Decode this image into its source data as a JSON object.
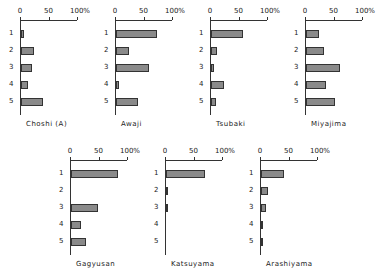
{
  "chart_data": [
    {
      "type": "bar",
      "orientation": "horizontal",
      "title": "Choshi (A)",
      "categories": [
        "1",
        "2",
        "3",
        "4",
        "5"
      ],
      "values": [
        5,
        23,
        20,
        12,
        38
      ],
      "xlim": [
        0,
        100
      ],
      "xticks": [
        "0",
        "50",
        "100%"
      ]
    },
    {
      "type": "bar",
      "orientation": "horizontal",
      "title": "Awaji",
      "categories": [
        "1",
        "2",
        "3",
        "4",
        "5"
      ],
      "values": [
        72,
        22,
        58,
        5,
        38
      ],
      "xlim": [
        0,
        100
      ],
      "xticks": [
        "0",
        "50",
        "100%"
      ]
    },
    {
      "type": "bar",
      "orientation": "horizontal",
      "title": "Tsubaki",
      "categories": [
        "1",
        "2",
        "3",
        "4",
        "5"
      ],
      "values": [
        57,
        10,
        5,
        22,
        8
      ],
      "xlim": [
        0,
        100
      ],
      "xticks": [
        "0",
        "50",
        "100%"
      ]
    },
    {
      "type": "bar",
      "orientation": "horizontal",
      "title": "Miyajima",
      "categories": [
        "1",
        "2",
        "3",
        "4",
        "5"
      ],
      "values": [
        22,
        32,
        60,
        35,
        50
      ],
      "xlim": [
        0,
        100
      ],
      "xticks": [
        "0",
        "50",
        "100%"
      ]
    },
    {
      "type": "bar",
      "orientation": "horizontal",
      "title": "Gagyusan",
      "categories": [
        "1",
        "2",
        "3",
        "4",
        "5"
      ],
      "values": [
        82,
        0,
        48,
        18,
        27
      ],
      "xlim": [
        0,
        100
      ],
      "xticks": [
        "0",
        "50",
        "100%"
      ]
    },
    {
      "type": "bar",
      "orientation": "horizontal",
      "title": "Katsuyama",
      "categories": [
        "1",
        "2",
        "3",
        "4",
        "5"
      ],
      "values": [
        68,
        4,
        2,
        0,
        0
      ],
      "xlim": [
        0,
        100
      ],
      "xticks": [
        "0",
        "50",
        "100%"
      ]
    },
    {
      "type": "bar",
      "orientation": "horizontal",
      "title": "Arashiyama",
      "categories": [
        "1",
        "2",
        "3",
        "4",
        "5"
      ],
      "values": [
        40,
        13,
        8,
        3,
        1
      ],
      "xlim": [
        0,
        100
      ],
      "xticks": [
        "0",
        "50",
        "100%"
      ]
    }
  ],
  "layout": {
    "panel_positions": [
      [
        0,
        0
      ],
      [
        95,
        0
      ],
      [
        190,
        0
      ],
      [
        285,
        0
      ],
      [
        50,
        140
      ],
      [
        145,
        140
      ],
      [
        240,
        140
      ]
    ],
    "axis_width_px": 57,
    "bar_color": "#8a8a8a",
    "border_color": "#333333"
  }
}
